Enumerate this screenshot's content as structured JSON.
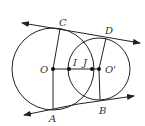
{
  "diagram": {
    "type": "two-circles-common-tangents",
    "circles": [
      {
        "name": "circle-O",
        "center": "O",
        "cx": 53,
        "cy": 69,
        "r": 41
      },
      {
        "name": "circle-O-prime",
        "center": "O'",
        "cx": 99,
        "cy": 69,
        "r": 31
      }
    ],
    "labels": {
      "C": "C",
      "D": "D",
      "O": "O",
      "I": "I",
      "J": "J",
      "O_prime": "O'",
      "A": "A",
      "B": "B"
    },
    "points": {
      "C": [
        60,
        29
      ],
      "D": [
        106,
        38
      ],
      "O": [
        53,
        69
      ],
      "I": [
        69,
        69
      ],
      "J": [
        92,
        69
      ],
      "O_prime": [
        99,
        69
      ],
      "A": [
        53,
        109
      ],
      "B": [
        100,
        100
      ]
    },
    "stroke_color": "#222222"
  }
}
